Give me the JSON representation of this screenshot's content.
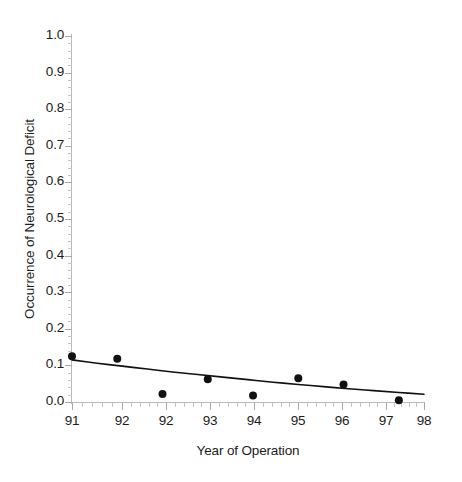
{
  "chart_data": {
    "type": "scatter",
    "title": "",
    "xlabel": "Year of Operation",
    "ylabel": "Occurrence of Neurological Deficit",
    "xlim": [
      91,
      98
    ],
    "ylim": [
      0.0,
      1.0
    ],
    "grid": false,
    "legend": null,
    "x_tick_labels": [
      "91",
      "92",
      "92",
      "93",
      "94",
      "95",
      "96",
      "97",
      "98"
    ],
    "x_tick_values": [
      91,
      92,
      92.875,
      93.75,
      94.625,
      95.5,
      96.375,
      97.25,
      98
    ],
    "y_tick_labels": [
      "0.0",
      "0.1",
      "0.2",
      "0.3",
      "0.4",
      "0.5",
      "0.6",
      "0.7",
      "0.8",
      "0.9",
      "1.0"
    ],
    "y_tick_values": [
      0.0,
      0.1,
      0.2,
      0.3,
      0.4,
      0.5,
      0.6,
      0.7,
      0.8,
      0.9,
      1.0
    ],
    "x_minor_ticks_per_interval": 5,
    "y_minor_ticks_per_interval": 5,
    "series": [
      {
        "name": "Observed occurrence",
        "type": "scatter",
        "marker": "filled-circle",
        "marker_size": 7,
        "color": "#111111",
        "points": [
          {
            "x": 91.0,
            "y": 0.125
          },
          {
            "x": 91.9,
            "y": 0.118
          },
          {
            "x": 92.8,
            "y": 0.022
          },
          {
            "x": 93.7,
            "y": 0.062
          },
          {
            "x": 94.6,
            "y": 0.018
          },
          {
            "x": 95.5,
            "y": 0.065
          },
          {
            "x": 96.4,
            "y": 0.048
          },
          {
            "x": 97.5,
            "y": 0.005
          }
        ]
      },
      {
        "name": "Fitted trend",
        "type": "line",
        "color": "#111111",
        "line_width": 1.6,
        "points": [
          {
            "x": 91.0,
            "y": 0.115
          },
          {
            "x": 91.5,
            "y": 0.106
          },
          {
            "x": 92.0,
            "y": 0.098
          },
          {
            "x": 92.5,
            "y": 0.09
          },
          {
            "x": 93.0,
            "y": 0.082
          },
          {
            "x": 93.5,
            "y": 0.075
          },
          {
            "x": 94.0,
            "y": 0.068
          },
          {
            "x": 94.5,
            "y": 0.061
          },
          {
            "x": 95.0,
            "y": 0.054
          },
          {
            "x": 95.5,
            "y": 0.048
          },
          {
            "x": 96.0,
            "y": 0.042
          },
          {
            "x": 96.5,
            "y": 0.036
          },
          {
            "x": 97.0,
            "y": 0.031
          },
          {
            "x": 97.5,
            "y": 0.026
          },
          {
            "x": 98.0,
            "y": 0.021
          }
        ]
      }
    ]
  },
  "axes": {
    "x_title": "Year of Operation",
    "y_title": "Occurrence of Neurological Deficit"
  },
  "colors": {
    "marker": "#111111",
    "curve": "#111111",
    "axis": "#b9b9b9",
    "tick": "#a8a8a8",
    "text": "#1c1c1c",
    "background": "#ffffff"
  }
}
